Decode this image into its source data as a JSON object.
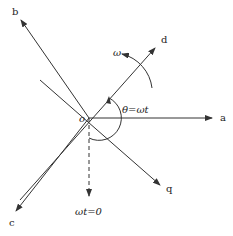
{
  "diagram": {
    "type": "vector-axes",
    "origin_label": "o",
    "axes": [
      {
        "name": "a",
        "label": "a"
      },
      {
        "name": "b",
        "label": "b"
      },
      {
        "name": "c",
        "label": "c"
      },
      {
        "name": "d",
        "label": "d"
      },
      {
        "name": "q",
        "label": "q"
      }
    ],
    "rotation_label": "ω",
    "angle_label": "θ=ωt",
    "reference_label": "ωt=0",
    "colors": {
      "line": "#333333",
      "background": "#ffffff"
    }
  }
}
